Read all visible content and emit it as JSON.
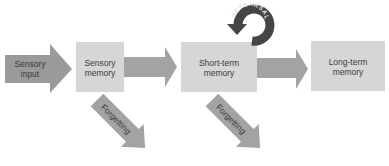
{
  "diagram": {
    "nodes": [
      {
        "id": "sensory-input",
        "label_line1": "Sensory",
        "label_line2": "input",
        "shape": "arrow"
      },
      {
        "id": "sensory-memory",
        "label_line1": "Sensory",
        "label_line2": "memory",
        "shape": "box"
      },
      {
        "id": "short-term-memory",
        "label_line1": "Short-term",
        "label_line2": "memory",
        "shape": "box"
      },
      {
        "id": "long-term-memory",
        "label_line1": "Long-term",
        "label_line2": "memory",
        "shape": "box"
      }
    ],
    "edges": [
      {
        "from": "sensory-input",
        "to": "sensory-memory"
      },
      {
        "from": "sensory-memory",
        "to": "short-term-memory"
      },
      {
        "from": "short-term-memory",
        "to": "long-term-memory"
      },
      {
        "from": "short-term-memory",
        "to": "short-term-memory",
        "label": "REHEARSAL"
      },
      {
        "from": "sensory-memory",
        "to": "forgetting",
        "label": "Forgetting"
      },
      {
        "from": "short-term-memory",
        "to": "forgetting",
        "label": "Forgetting"
      }
    ],
    "rehearsal_label": "REHEARSAL",
    "forgetting_label_1": "Forgetting",
    "forgetting_label_2": "Forgetting",
    "colors": {
      "input_arrow": "#9a9a9a",
      "box": "#d6d6d6",
      "flow_arrow": "#a3a3a3",
      "rehearsal": "#454545",
      "text": "#3a3a3a"
    }
  }
}
